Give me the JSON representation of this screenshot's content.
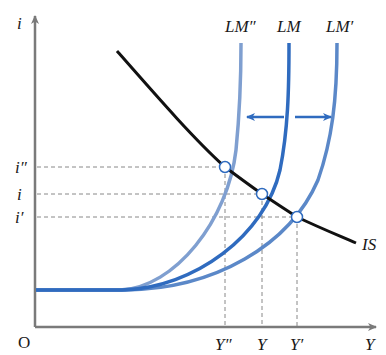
{
  "diagram": {
    "axes": {
      "y_label": "i",
      "x_label": "Y",
      "origin_label": "O"
    },
    "curves": {
      "is": {
        "label": "IS",
        "color": "#111111"
      },
      "lm": {
        "label": "LM",
        "color": "#2f6bbf"
      },
      "lm_prime": {
        "label": "LM′",
        "color": "#5b88c8"
      },
      "lm_double_prime": {
        "label": "LM″",
        "color": "#7f9fd0"
      }
    },
    "interest_levels": {
      "i_double_prime": "i″",
      "i": "i",
      "i_prime": "i′"
    },
    "output_levels": {
      "y_double_prime": "Y″",
      "y": "Y",
      "y_prime": "Y′"
    },
    "shift_arrows": {
      "left": "shift-left",
      "right": "shift-right",
      "color": "#2f6bbf"
    },
    "colors": {
      "axis": "#7a7a7a",
      "guide": "#888888",
      "text": "#1a1a1a"
    }
  }
}
